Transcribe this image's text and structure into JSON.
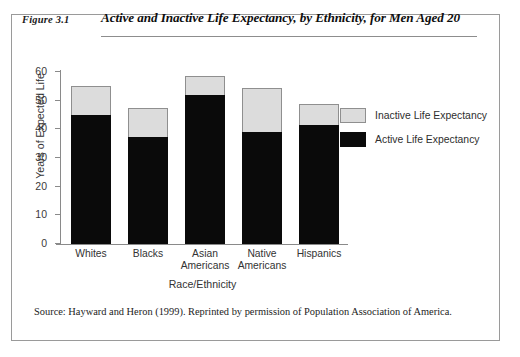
{
  "figure": {
    "number": "Figure 3.1",
    "title": "Active and Inactive Life Expectancy, by Ethnicity, for Men Aged 20",
    "source": "Source: Hayward and Heron (1999). Reprinted by permission of Population Association of America."
  },
  "colors": {
    "active": "#0a0a0a",
    "inactive": "#dcdcdc",
    "bar_outline": "#8f8f8f",
    "axis": "#8a8a8a",
    "rule": "#111111",
    "page_background": "#ffffff"
  },
  "chart_data": {
    "type": "bar",
    "stacked": true,
    "title": "Active and Inactive Life Expectancy, by Ethnicity, for Men Aged 20",
    "xlabel": "Race/Ethnicity",
    "ylabel": "Years of Expected Life",
    "ylim": [
      0,
      60
    ],
    "yticks": [
      0,
      10,
      20,
      30,
      40,
      50,
      60
    ],
    "grid": false,
    "legend_position": "right",
    "categories": [
      "Whites",
      "Blacks",
      "Asian Americans",
      "Native Americans",
      "Hispanics"
    ],
    "category_lines": [
      [
        "Whites"
      ],
      [
        "Blacks"
      ],
      [
        "Asian",
        "Americans"
      ],
      [
        "Native",
        "Americans"
      ],
      [
        "Hispanics"
      ]
    ],
    "series": [
      {
        "name": "Active Life Expectancy",
        "color": "#0a0a0a",
        "values": [
          45,
          37.5,
          52,
          39,
          41.5
        ]
      },
      {
        "name": "Inactive Life Expectancy",
        "color": "#dcdcdc",
        "values": [
          10,
          10,
          6.5,
          15.5,
          7.5
        ]
      }
    ],
    "totals": [
      55,
      47.5,
      58.5,
      54.5,
      49
    ]
  },
  "legend": {
    "entries": [
      {
        "label": "Inactive Life Expectancy",
        "swatch": "inactive"
      },
      {
        "label": "Active Life Expectancy",
        "swatch": "active"
      }
    ]
  }
}
